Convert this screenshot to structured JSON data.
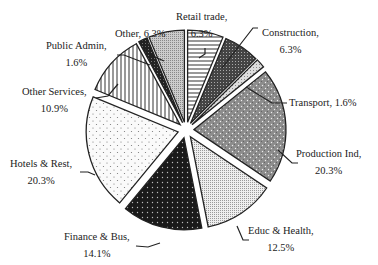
{
  "chart_data": {
    "type": "pie",
    "title": "",
    "exploded": true,
    "start_angle_deg": 0,
    "direction": "clockwise",
    "slices": [
      {
        "label": "Retail trade",
        "value": 6.3,
        "pattern": "hlines",
        "fill": "#ffffff"
      },
      {
        "label": "Construction",
        "value": 6.3,
        "pattern": "darkdots",
        "fill": "#555555"
      },
      {
        "label": "Transport",
        "value": 1.6,
        "pattern": "diag",
        "fill": "#dddddd"
      },
      {
        "label": "Production Ind",
        "value": 20.3,
        "pattern": "graydots",
        "fill": "#8a8a8a"
      },
      {
        "label": "Educ & Health",
        "value": 12.5,
        "pattern": "finedots",
        "fill": "#d8d8d8"
      },
      {
        "label": "Finance & Bus",
        "value": 14.1,
        "pattern": "blackdots",
        "fill": "#1a1a1a"
      },
      {
        "label": "Hotels & Rest",
        "value": 20.3,
        "pattern": "sparsedots",
        "fill": "#f6f6f6"
      },
      {
        "label": "Other Services",
        "value": 10.9,
        "pattern": "vlines",
        "fill": "#ffffff"
      },
      {
        "label": "Public Admin",
        "value": 1.6,
        "pattern": "black",
        "fill": "#222222"
      },
      {
        "label": "Other",
        "value": 6.3,
        "pattern": "lightgray",
        "fill": "#bbbbbb"
      }
    ]
  },
  "labels": {
    "retail": {
      "line1": "Retail trade,",
      "line2": "6.3%"
    },
    "construction": {
      "line1": "Construction,",
      "line2": "6.3%"
    },
    "transport": {
      "line1": "Transport, 1.6%"
    },
    "production": {
      "line1": "Production Ind,",
      "line2": "20.3%"
    },
    "educ": {
      "line1": "Educ & Health,",
      "line2": "12.5%"
    },
    "finance": {
      "line1": "Finance & Bus,",
      "line2": "14.1%"
    },
    "hotels": {
      "line1": "Hotels & Rest,",
      "line2": "20.3%"
    },
    "otherserv": {
      "line1": "Other Services,",
      "line2": "10.9%"
    },
    "publicadmin": {
      "line1": "Public Admin,",
      "line2": "1.6%"
    },
    "other": {
      "line1": "Other, 6.3%"
    }
  }
}
